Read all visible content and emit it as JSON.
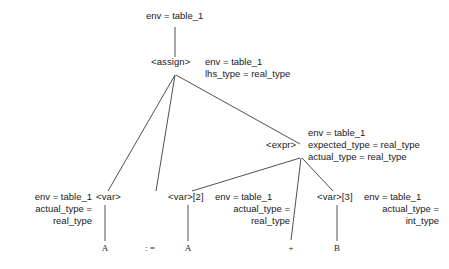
{
  "diagram": {
    "type": "annotated-parse-tree",
    "title": "",
    "stroke_color": "#3b3b3b",
    "text_color": "#1a1a1a",
    "background": "#ffffff",
    "root": {
      "annotation_lines": [
        "env = table_1"
      ]
    },
    "nodes": [
      {
        "id": "assign",
        "label": "<assign>",
        "annotation_lines": [
          "env = table_1",
          "lhs_type = real_type"
        ]
      },
      {
        "id": "expr",
        "label": "<expr>",
        "annotation_lines": [
          "env = table_1",
          "expected_type = real_type",
          "actual_type = real_type"
        ]
      },
      {
        "id": "var1",
        "label": "<var>",
        "annotation_lines": [
          "env = table_1",
          "actual_type =",
          "real_type"
        ]
      },
      {
        "id": "var2",
        "label": "<var>[2]",
        "annotation_lines": [
          "env = table_1",
          "actual_type =",
          "real_type"
        ]
      },
      {
        "id": "var3",
        "label": "<var>[3]",
        "annotation_lines": [
          "env = table_1",
          "actual_type =",
          "int_type"
        ]
      }
    ],
    "terminals": [
      {
        "id": "terminal-a1",
        "label": "A"
      },
      {
        "id": "terminal-assignop",
        "label": ": ="
      },
      {
        "id": "terminal-a2",
        "label": "A"
      },
      {
        "id": "terminal-plus",
        "label": "+"
      },
      {
        "id": "terminal-b",
        "label": "B"
      }
    ]
  }
}
